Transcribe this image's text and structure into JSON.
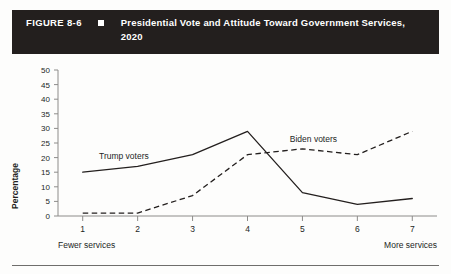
{
  "header": {
    "figure_number": "FIGURE 8-6",
    "bullet": "square-bullet",
    "title": "Presidential Vote and Attitude Toward Government Services, 2020"
  },
  "chart_data": {
    "type": "line",
    "title": "Presidential Vote and Attitude Toward Government Services, 2020",
    "xlabel": "",
    "ylabel": "Percentage",
    "x": [
      1,
      2,
      3,
      4,
      5,
      6,
      7
    ],
    "xticklabels": [
      "1",
      "2",
      "3",
      "4",
      "5",
      "6",
      "7"
    ],
    "xlim": [
      0.55,
      7.45
    ],
    "ylim": [
      0,
      50
    ],
    "yticks": [
      0,
      5,
      10,
      15,
      20,
      25,
      30,
      35,
      40,
      45,
      50
    ],
    "yticklabels": [
      "0",
      "5",
      "10",
      "15",
      "20",
      "25",
      "30",
      "35",
      "40",
      "45",
      "50"
    ],
    "grid": false,
    "legend_position": "inline-annotation",
    "x_axis_left_note": "Fewer services",
    "x_axis_right_note": "More services",
    "series": [
      {
        "name": "Trump voters",
        "style": "solid",
        "values": [
          15,
          17,
          21,
          29,
          8,
          4,
          6
        ]
      },
      {
        "name": "Biden voters",
        "style": "dashed",
        "values": [
          1,
          1,
          7,
          21,
          23,
          21,
          29
        ]
      }
    ],
    "annotations": [
      {
        "text": "Trump voters",
        "x": 1.75,
        "y": 19.5
      },
      {
        "text": "Biden voters",
        "x": 5.2,
        "y": 25.5
      }
    ]
  }
}
